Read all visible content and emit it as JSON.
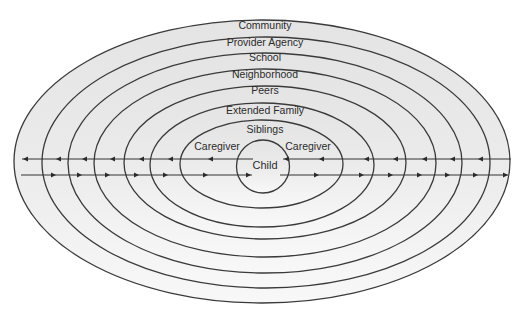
{
  "diagram": {
    "colors": {
      "background": "#ffffff",
      "fill_top": "#e6e6e6",
      "fill_bottom": "#f7f7f7",
      "stroke": "#3a3a3a"
    },
    "rings": [
      {
        "label": "Community",
        "cx": 262,
        "cy": 161.5,
        "rx": 248,
        "ry": 141.5,
        "label_y": 26
      },
      {
        "label": "Provider Agency",
        "cx": 266,
        "cy": 162.5,
        "rx": 224,
        "ry": 125.5,
        "label_y": 43
      },
      {
        "label": "School",
        "cx": 265,
        "cy": 163,
        "rx": 197,
        "ry": 110,
        "label_y": 58
      },
      {
        "label": "Neighborhood",
        "cx": 265,
        "cy": 163,
        "rx": 171,
        "ry": 94,
        "label_y": 75
      },
      {
        "label": "Peers",
        "cx": 265,
        "cy": 162.5,
        "rx": 141,
        "ry": 76.5,
        "label_y": 91
      },
      {
        "label": "Extended Family",
        "cx": 262,
        "cy": 165,
        "rx": 112,
        "ry": 62,
        "label_y": 111
      },
      {
        "label": "Siblings",
        "cx": 261.5,
        "cy": 164,
        "rx": 81.5,
        "ry": 44,
        "label_y": 130
      }
    ],
    "center": {
      "label": "Child",
      "cx": 263,
      "cy": 166.5,
      "r": 26.5
    },
    "caregivers": [
      {
        "label": "Caregiver",
        "x": 217,
        "y": 147
      },
      {
        "label": "Caregiver",
        "x": 308,
        "y": 147
      }
    ],
    "flows": {
      "top_y": 159,
      "bottom_y": 175,
      "top_left": {
        "x1": 22,
        "x2": 253,
        "direction": "left",
        "arrows_x": [
          23,
          56,
          82,
          110,
          139,
          168,
          208
        ]
      },
      "top_right": {
        "x1": 283,
        "x2": 511,
        "direction": "left",
        "arrows_x": [
          284,
          319,
          364,
          393,
          422,
          450,
          478
        ]
      },
      "bottom_left": {
        "x1": 21,
        "x2": 252,
        "direction": "right",
        "arrows_x": [
          56,
          82,
          110,
          139,
          168,
          208,
          251
        ]
      },
      "bottom_right": {
        "x1": 280,
        "x2": 508,
        "direction": "right",
        "arrows_x": [
          319,
          364,
          393,
          422,
          450,
          478,
          508
        ]
      }
    }
  }
}
